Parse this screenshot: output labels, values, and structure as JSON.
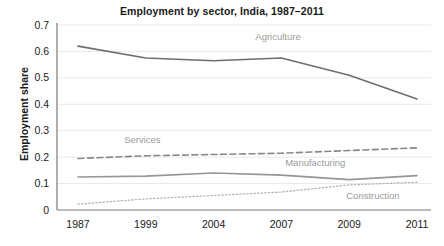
{
  "chart_data": {
    "type": "line",
    "title": "Employment by sector, India, 1987–2011",
    "xlabel": "",
    "ylabel": "Employment share",
    "categories": [
      "1987",
      "1999",
      "2004",
      "2007",
      "2009",
      "2011"
    ],
    "ylim": [
      0,
      0.7
    ],
    "yticks": [
      "0",
      "0.1",
      "0.2",
      "0.3",
      "0.4",
      "0.5",
      "0.6",
      "0.7"
    ],
    "ytick_values": [
      0,
      0.1,
      0.2,
      0.3,
      0.4,
      0.5,
      0.6,
      0.7
    ],
    "grid": true,
    "grid_axis": "y",
    "legend": "inline-annotations",
    "series": [
      {
        "name": "Agriculture",
        "values": [
          0.62,
          0.575,
          0.565,
          0.575,
          0.51,
          0.42
        ],
        "style": "solid",
        "color": "#6e6e6e",
        "annotation": {
          "label": "Agriculture",
          "x_index": 2.95,
          "value": 0.645
        }
      },
      {
        "name": "Services",
        "values": [
          0.195,
          0.205,
          0.21,
          0.215,
          0.225,
          0.235
        ],
        "style": "dashed",
        "color": "#888888",
        "annotation": {
          "label": "Services",
          "x_index": 0.95,
          "value": 0.255
        }
      },
      {
        "name": "Manufacturing",
        "values": [
          0.125,
          0.128,
          0.14,
          0.132,
          0.115,
          0.13
        ],
        "style": "solid",
        "color": "#969696",
        "annotation": {
          "label": "Manufacturing",
          "x_index": 3.5,
          "value": 0.165
        }
      },
      {
        "name": "Construction",
        "values": [
          0.022,
          0.042,
          0.055,
          0.068,
          0.095,
          0.105
        ],
        "style": "dotted",
        "color": "#b5b5b5",
        "annotation": {
          "label": "Construction",
          "x_index": 4.35,
          "value": 0.04
        }
      }
    ]
  }
}
